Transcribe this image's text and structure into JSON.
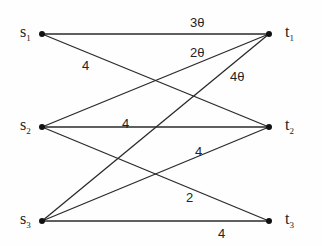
{
  "diagram": {
    "type": "bipartite-graph",
    "sources": [
      {
        "id": "s1",
        "label": "s",
        "sub": "1",
        "x": 42,
        "y": 34
      },
      {
        "id": "s2",
        "label": "s",
        "sub": "2",
        "x": 42,
        "y": 127
      },
      {
        "id": "s3",
        "label": "s",
        "sub": "3",
        "x": 42,
        "y": 221
      }
    ],
    "sinks": [
      {
        "id": "t1",
        "label": "t",
        "sub": "1",
        "x": 269,
        "y": 34
      },
      {
        "id": "t2",
        "label": "t",
        "sub": "2",
        "x": 269,
        "y": 127
      },
      {
        "id": "t3",
        "label": "t",
        "sub": "3",
        "x": 269,
        "y": 221
      }
    ],
    "edges": [
      {
        "from": "s1",
        "to": "t1",
        "weight": "3θ",
        "lx": 190,
        "ly": 16
      },
      {
        "from": "s1",
        "to": "t2",
        "weight": "4",
        "lx": 82,
        "ly": 59
      },
      {
        "from": "s2",
        "to": "t1",
        "weight": "2θ",
        "lx": 190,
        "ly": 46
      },
      {
        "from": "s2",
        "to": "t2",
        "weight": "4",
        "lx": 122,
        "ly": 117
      },
      {
        "from": "s2",
        "to": "t3",
        "weight": "2",
        "lx": 186,
        "ly": 191
      },
      {
        "from": "s3",
        "to": "t1",
        "weight": "4θ",
        "lx": 230,
        "ly": 70
      },
      {
        "from": "s3",
        "to": "t2",
        "weight": "4",
        "lx": 195,
        "ly": 145
      },
      {
        "from": "s3",
        "to": "t3",
        "weight": "4",
        "lx": 218,
        "ly": 227
      }
    ]
  }
}
